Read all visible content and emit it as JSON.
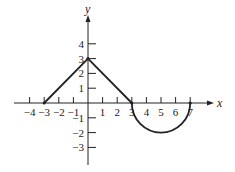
{
  "chart_data": {
    "type": "line",
    "title": "",
    "xlabel": "x",
    "ylabel": "y",
    "xlim": [
      -4,
      7
    ],
    "ylim": [
      -3,
      4
    ],
    "grid": false,
    "x_ticks": [
      -4,
      -3,
      -2,
      -1,
      1,
      2,
      3,
      4,
      5,
      6,
      7
    ],
    "y_ticks": [
      4,
      3,
      2,
      1,
      -1,
      -2,
      -3
    ],
    "segments": [
      {
        "kind": "line",
        "from": [
          -3,
          0
        ],
        "to": [
          0,
          3
        ]
      },
      {
        "kind": "line",
        "from": [
          0,
          3
        ],
        "to": [
          3,
          0
        ]
      },
      {
        "kind": "semicircle",
        "center": [
          5,
          0
        ],
        "radius": 2,
        "half": "lower",
        "from": [
          3,
          0
        ],
        "to": [
          7,
          0
        ]
      }
    ],
    "points": [
      [
        -3,
        0
      ],
      [
        0,
        3
      ],
      [
        3,
        0
      ],
      [
        7,
        0
      ]
    ]
  },
  "labels": {
    "x_axis": "x",
    "y_axis": "y",
    "x_ticks": [
      "−4",
      "−3",
      "−2",
      "−1",
      "1",
      "2",
      "3",
      "4",
      "5",
      "6",
      "7"
    ],
    "y_ticks": [
      "4",
      "3",
      "2",
      "1",
      "−1",
      "−2",
      "−3"
    ]
  }
}
